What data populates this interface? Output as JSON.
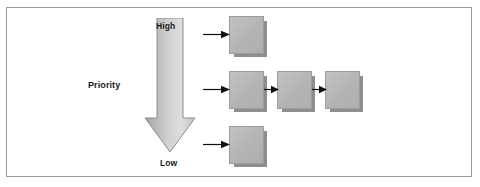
{
  "figure": {
    "frame": {
      "visible": true,
      "border_color": "#9a9a9a"
    },
    "background_color": "#ffffff"
  },
  "priority_axis": {
    "name": "priority-arrow",
    "direction": "down",
    "axis_title": "Priority",
    "top_label": "High",
    "bottom_label": "Low",
    "gradient_from": "#9f9f9f",
    "gradient_to": "#dedede",
    "outline_color": "#8d8d8d"
  },
  "nodes": [
    {
      "id": "node-high",
      "row": "high",
      "label": "",
      "fill": "#b8b8b8",
      "shadow": "#8e8e8e"
    },
    {
      "id": "node-mid-1",
      "row": "medium",
      "label": "",
      "fill": "#b8b8b8",
      "shadow": "#8e8e8e"
    },
    {
      "id": "node-mid-2",
      "row": "medium",
      "label": "",
      "fill": "#b8b8b8",
      "shadow": "#8e8e8e"
    },
    {
      "id": "node-mid-3",
      "row": "medium",
      "label": "",
      "fill": "#b8b8b8",
      "shadow": "#8e8e8e"
    },
    {
      "id": "node-low",
      "row": "low",
      "label": "",
      "fill": "#b8b8b8",
      "shadow": "#8e8e8e"
    }
  ],
  "connectors": [
    {
      "id": "conn-in-high",
      "from": "priority-axis",
      "to": "node-high",
      "style": "arrow-right"
    },
    {
      "id": "conn-in-mid",
      "from": "priority-axis",
      "to": "node-mid-1",
      "style": "arrow-right"
    },
    {
      "id": "conn-in-low",
      "from": "priority-axis",
      "to": "node-low",
      "style": "arrow-right"
    },
    {
      "id": "conn-mid-1-2",
      "from": "node-mid-1",
      "to": "node-mid-2",
      "style": "arrow-right"
    },
    {
      "id": "conn-mid-2-3",
      "from": "node-mid-2",
      "to": "node-mid-3",
      "style": "arrow-right"
    }
  ]
}
